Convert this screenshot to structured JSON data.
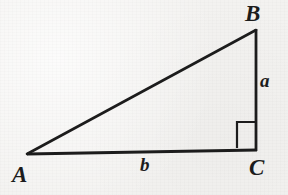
{
  "figure": {
    "type": "right-triangle-diagram",
    "background_color": "#f3f2f0",
    "stroke_color": "#1c1c1c",
    "label_color": "#1c1c1c",
    "width": 288,
    "height": 195,
    "vertices": [
      {
        "name": "A",
        "label": "A",
        "x": 27,
        "y": 154,
        "angle": "acute"
      },
      {
        "name": "B",
        "label": "B",
        "x": 256,
        "y": 30,
        "angle": "acute"
      },
      {
        "name": "C",
        "label": "C",
        "x": 256,
        "y": 150,
        "angle": "right"
      }
    ],
    "sides": [
      {
        "name": "a",
        "label": "a",
        "from": "B",
        "to": "C",
        "description": "vertical leg opposite vertex A"
      },
      {
        "name": "b",
        "label": "b",
        "from": "A",
        "to": "C",
        "description": "horizontal leg opposite vertex B"
      },
      {
        "name": "c",
        "label": "",
        "from": "A",
        "to": "B",
        "description": "hypotenuse, unlabeled"
      }
    ],
    "right_angle_marker": {
      "at_vertex": "C",
      "x": 237,
      "y": 122,
      "size": 18
    }
  }
}
